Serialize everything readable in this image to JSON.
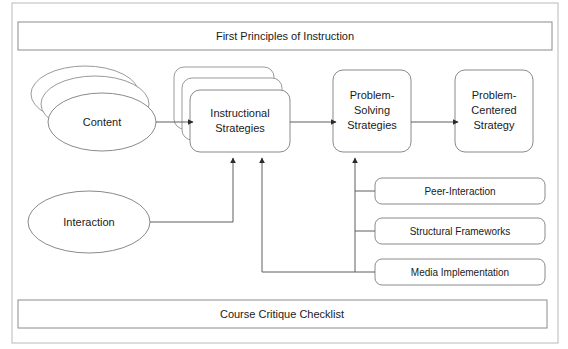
{
  "diagram": {
    "title_bar": {
      "label": "First Principles of Instruction"
    },
    "footer_bar": {
      "label": "Course Critique Checklist"
    },
    "inputs": [
      {
        "id": "content",
        "label": "Content",
        "shape": "stacked-ellipse",
        "stack_count": 3
      },
      {
        "id": "interaction",
        "label": "Interaction",
        "shape": "ellipse",
        "stack_count": 1
      }
    ],
    "process_stages": [
      {
        "id": "instructional-strategies",
        "label_line1": "Instructional",
        "label_line2": "Strategies",
        "shape": "stacked-rounded-rect",
        "stack_count": 3
      },
      {
        "id": "problem-solving-strategies",
        "label_line1": "Problem-",
        "label_line2": "Solving",
        "label_line3": "Strategies",
        "shape": "rounded-rect",
        "stack_count": 1
      },
      {
        "id": "problem-centered-strategy",
        "label_line1": "Problem-",
        "label_line2": "Centered",
        "label_line3": "Strategy",
        "shape": "rounded-rect",
        "stack_count": 1
      }
    ],
    "support_boxes": [
      {
        "id": "peer-interaction",
        "label": "Peer-Interaction"
      },
      {
        "id": "structural-frameworks",
        "label": "Structural Frameworks"
      },
      {
        "id": "media-implementation",
        "label": "Media Implementation"
      }
    ],
    "colors": {
      "background": "#ffffff",
      "shape_stroke": "#8a8a8a",
      "connector_stroke": "#5f5f5f",
      "frame_stroke": "#b9b9b9",
      "text": "#1a1a1a"
    }
  }
}
